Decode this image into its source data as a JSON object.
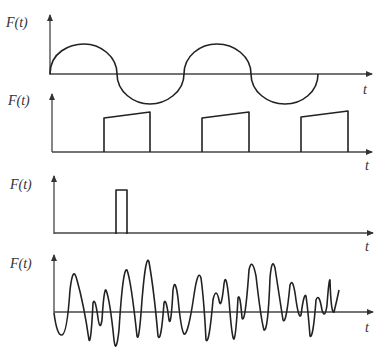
{
  "figure": {
    "background": "#ffffff",
    "line_color": "#222222",
    "axis_color": "#444444",
    "panels": [
      {
        "id": "harmonic",
        "description": "Sinusoidal (harmonic) force",
        "y_label": "F(t)",
        "x_label": "t",
        "axis": {
          "origin": [
            50,
            74
          ],
          "y_top": 15,
          "x_end": 372
        },
        "label_pos": {
          "ylabel": [
            8,
            26
          ],
          "xlabel": [
            364,
            94
          ]
        },
        "path": "M50,74 C50,52 70,44 84,44 C100,44 117,56 117,74 C117,92 134,104 150,104 C166,104 184,92 184,74 C184,56 200,44 217,44 C234,44 251,56 251,74 C251,92 268,104 285,104 C302,104 318,92 318,74"
      },
      {
        "id": "periodic-pulses",
        "description": "Periodic trapezoidal pulses",
        "y_label": "F(t)",
        "x_label": "",
        "axis": {
          "origin": [
            52,
            152
          ],
          "y_top": 94,
          "x_end": 372
        },
        "label_pos": {
          "ylabel": [
            10,
            103
          ]
        },
        "path": "M104,152 L104,118 L150,112 L150,152 M202,152 L202,118 L249,112 L249,152 M301,152 L301,117 L348,111 L348,152"
      },
      {
        "id": "single-pulse",
        "description": "Single rectangular impulse",
        "y_label": "F(t)",
        "x_label": "t",
        "axis": {
          "origin": [
            54,
            234
          ],
          "y_top": 176,
          "x_end": 373
        },
        "label_pos": {
          "ylabel": [
            12,
            187
          ],
          "xlabel": [
            366,
            170
          ]
        },
        "path": "M116,234 L116,190 L127,190 L127,234"
      },
      {
        "id": "random",
        "description": "Random (stochastic) force",
        "y_label": "F(t)",
        "x_label": "t",
        "axis": {
          "origin": [
            54,
            313
          ],
          "y_top": 255,
          "x_end": 373
        },
        "label_pos": {
          "ylabel": [
            12,
            267
          ],
          "xlabel": [
            366,
            250
          ],
          "xlabel2": [
            366,
            330
          ]
        },
        "path": "M54,313 Q57,336 62,335 Q67,334 70,290 Q73,264 77,280 Q84,305 89,340 Q91,344 93,303 Q95,296 98,318 Q100,332 102,320 Q104,288 106,290 Q110,300 114,340 Q116,356 119,330 Q123,266 127,270 Q131,280 137,336 Q139,344 142,300 Q146,252 149,262 Q154,290 158,336 Q161,344 164,303 Q166,296 169,320 Q171,328 173,290 Q175,276 178,298 Q181,330 184,334 Q188,336 194,295 Q198,268 201,278 Q204,300 206,340 Q209,346 213,300 Q216,286 219,300 Q221,312 224,284 Q226,270 229,300 Q232,340 234,339 Q236,336 238,298 Q240,292 242,318 Q245,326 249,270 Q252,256 256,276 Q261,320 264,330 Q268,332 270,278 Q272,256 275,268 Q280,300 283,320 Q286,326 290,285 Q293,276 296,300 Q299,320 301,315 Q304,292 306,296 Q308,310 310,336 Q313,340 316,300 Q319,292 322,310 Q325,320 327,305 Q329,278 330,280 Q331,314 334,312 Q337,300 339,290"
      }
    ]
  }
}
